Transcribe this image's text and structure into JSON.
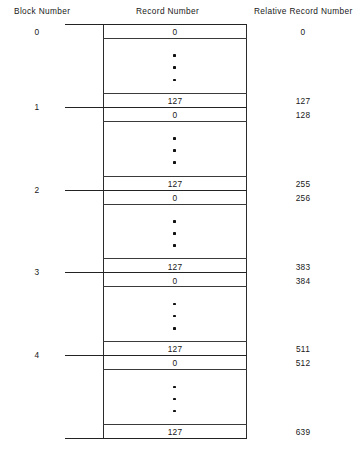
{
  "figure": {
    "type": "block-record-layout-diagram",
    "headers": {
      "block_number": "Block Number",
      "record_number": "Record Number",
      "relative_record_number": "Relative Record Number"
    },
    "ellipsis_glyph": "•",
    "records_per_block": 128,
    "total_relative_records": 640,
    "colors": {
      "background": "#ffffff",
      "line": "#2b2b2b",
      "text": "#181818"
    },
    "blocks": [
      {
        "block_number": "0",
        "first_record_number": "0",
        "last_record_number": "127",
        "first_relative_record_number": "0",
        "last_relative_record_number": "127"
      },
      {
        "block_number": "1",
        "first_record_number": "0",
        "last_record_number": "127",
        "first_relative_record_number": "128",
        "last_relative_record_number": "255"
      },
      {
        "block_number": "2",
        "first_record_number": "0",
        "last_record_number": "127",
        "first_relative_record_number": "256",
        "last_relative_record_number": "383"
      },
      {
        "block_number": "3",
        "first_record_number": "0",
        "last_record_number": "127",
        "first_relative_record_number": "384",
        "last_relative_record_number": "511"
      },
      {
        "block_number": "4",
        "first_record_number": "0",
        "last_record_number": "127",
        "first_relative_record_number": "512",
        "last_relative_record_number": "639"
      }
    ]
  }
}
